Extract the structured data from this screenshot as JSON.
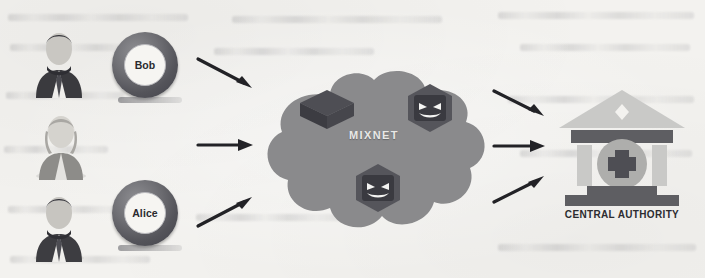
{
  "figure": {
    "background_color": "#f3f2ef"
  },
  "senders": [
    {
      "name": "Bob",
      "avatar": "businessman-avatar-icon",
      "badge": "user-ring-badge"
    },
    {
      "name": "Alice",
      "avatar": "businesswoman-avatar-icon",
      "badge": "user-ring-badge"
    },
    {
      "name": "David",
      "avatar": "businessman-avatar-icon",
      "badge": "user-ring-badge"
    }
  ],
  "inbound_arrows": [
    {
      "name": "arrow-bob-to-mixnet",
      "direction": "down-right"
    },
    {
      "name": "arrow-alice-to-mixnet",
      "direction": "right"
    },
    {
      "name": "arrow-david-to-mixnet",
      "direction": "up-right"
    }
  ],
  "mixnet": {
    "label": "MIXNET",
    "cloud_color": "#8a8a8c",
    "label_color": "#e8e8e6",
    "nodes": [
      {
        "name": "honest-mix-node",
        "type": "plain-server-box-icon",
        "malicious": false
      },
      {
        "name": "malicious-mix-node-1",
        "type": "evil-server-box-icon",
        "malicious": true
      },
      {
        "name": "malicious-mix-node-2",
        "type": "evil-server-box-icon",
        "malicious": true
      }
    ]
  },
  "outbound_arrows": [
    {
      "name": "arrow-mixnet-to-authority-top",
      "direction": "down-right"
    },
    {
      "name": "arrow-mixnet-to-authority-middle",
      "direction": "right"
    },
    {
      "name": "arrow-mixnet-to-authority-bottom",
      "direction": "up-right"
    }
  ],
  "authority": {
    "label": "CENTRAL AUTHORITY",
    "icon": "classical-bank-building-icon",
    "emblem": "cross-in-circle-icon",
    "roof_color": "#c8c8c6",
    "bar_color": "#5e5e62",
    "emblem_color": "#4e4e54"
  }
}
